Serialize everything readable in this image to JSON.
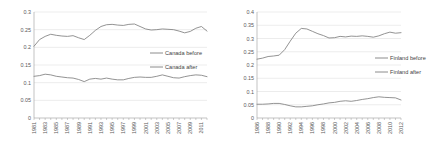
{
  "figure": {
    "background": "#ffffff",
    "line_color": "#808080",
    "grid_color": "#d9d9d9",
    "axis_color": "#9c9c9c",
    "text_color": "#595959"
  },
  "chart_data": [
    {
      "id": "canada",
      "type": "line",
      "title": "",
      "xlabel": "",
      "ylabel": "",
      "ylim": [
        0,
        0.3
      ],
      "yticks": [
        "0",
        "0.05",
        "0.1",
        "0.15",
        "0.2",
        "0.25",
        "0.3"
      ],
      "ytick_values": [
        0,
        0.05,
        0.1,
        0.15,
        0.2,
        0.25,
        0.3
      ],
      "grid": true,
      "legend_position": "center-right",
      "x": [
        1981,
        1982,
        1983,
        1984,
        1985,
        1986,
        1987,
        1988,
        1989,
        1990,
        1991,
        1992,
        1993,
        1994,
        1995,
        1996,
        1997,
        1998,
        1999,
        2000,
        2001,
        2002,
        2003,
        2004,
        2005,
        2006,
        2007,
        2008,
        2009,
        2010,
        2011,
        2012
      ],
      "xtick_labels": [
        "1981",
        "1983",
        "1985",
        "1987",
        "1989",
        "1991",
        "1993",
        "1995",
        "1997",
        "1999",
        "2001",
        "2003",
        "2005",
        "2007",
        "2009",
        "2011"
      ],
      "series": [
        {
          "name": "Canada before",
          "values": [
            0.203,
            0.222,
            0.231,
            0.237,
            0.234,
            0.232,
            0.231,
            0.233,
            0.227,
            0.222,
            0.234,
            0.248,
            0.259,
            0.264,
            0.265,
            0.263,
            0.262,
            0.265,
            0.266,
            0.259,
            0.252,
            0.249,
            0.25,
            0.252,
            0.251,
            0.25,
            0.246,
            0.241,
            0.245,
            0.254,
            0.259,
            0.246
          ]
        },
        {
          "name": "Canada after",
          "values": [
            0.118,
            0.12,
            0.124,
            0.122,
            0.118,
            0.116,
            0.114,
            0.113,
            0.109,
            0.103,
            0.11,
            0.112,
            0.11,
            0.113,
            0.11,
            0.108,
            0.108,
            0.112,
            0.115,
            0.116,
            0.115,
            0.115,
            0.118,
            0.122,
            0.118,
            0.114,
            0.113,
            0.117,
            0.12,
            0.122,
            0.121,
            0.117
          ]
        }
      ]
    },
    {
      "id": "finland",
      "type": "line",
      "title": "",
      "xlabel": "",
      "ylabel": "",
      "ylim": [
        0,
        0.4
      ],
      "yticks": [
        "0",
        "0.05",
        "0.1",
        "0.15",
        "0.2",
        "0.25",
        "0.3",
        "0.35",
        "0.4"
      ],
      "ytick_values": [
        0,
        0.05,
        0.1,
        0.15,
        0.2,
        0.25,
        0.3,
        0.35,
        0.4
      ],
      "grid": true,
      "legend_position": "center-right",
      "x": [
        1986,
        1987,
        1988,
        1989,
        1990,
        1991,
        1992,
        1993,
        1994,
        1995,
        1996,
        1997,
        1998,
        1999,
        2000,
        2001,
        2002,
        2003,
        2004,
        2005,
        2006,
        2007,
        2008,
        2009,
        2010,
        2011,
        2012
      ],
      "xtick_labels": [
        "1986",
        "1988",
        "1990",
        "1992",
        "1994",
        "1996",
        "1998",
        "2000",
        "2002",
        "2004",
        "2006",
        "2008",
        "2010",
        "2012"
      ],
      "series": [
        {
          "name": "Finland before",
          "values": [
            0.222,
            0.226,
            0.232,
            0.234,
            0.237,
            0.258,
            0.29,
            0.32,
            0.338,
            0.336,
            0.327,
            0.318,
            0.311,
            0.302,
            0.303,
            0.308,
            0.306,
            0.309,
            0.308,
            0.31,
            0.308,
            0.305,
            0.31,
            0.318,
            0.324,
            0.32,
            0.322
          ]
        },
        {
          "name": "Finland after",
          "values": [
            0.052,
            0.052,
            0.053,
            0.055,
            0.055,
            0.051,
            0.046,
            0.042,
            0.042,
            0.044,
            0.046,
            0.05,
            0.053,
            0.057,
            0.059,
            0.063,
            0.065,
            0.063,
            0.066,
            0.07,
            0.073,
            0.077,
            0.08,
            0.078,
            0.077,
            0.076,
            0.068
          ]
        }
      ]
    }
  ]
}
